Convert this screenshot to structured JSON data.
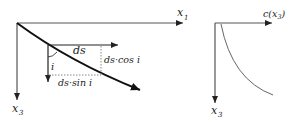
{
  "left_panel": {
    "axis_horizontal_label": "x",
    "axis_horizontal_sub": "1",
    "axis_vertical_label": "x",
    "axis_vertical_sub": "3",
    "element_label": "ds",
    "angle_label": "i",
    "horizontal_component_label": "ds·sin i",
    "vertical_component_label": "ds·cos i"
  },
  "right_panel": {
    "axis_horizontal_label": "c(x",
    "axis_horizontal_sub": "3",
    "axis_horizontal_close": ")",
    "axis_vertical_label": "x",
    "axis_vertical_sub": "3"
  },
  "colors": {
    "ink": "#222222",
    "axis": "#555555",
    "dotted": "#888888",
    "curve_right": "#666666"
  }
}
